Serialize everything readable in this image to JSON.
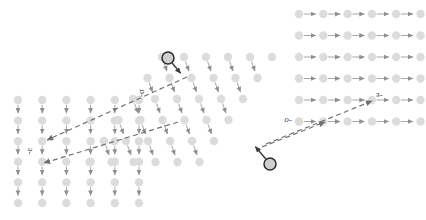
{
  "figure": {
    "type": "lattice-transition-diagram",
    "background": "#ffffff",
    "node_color": "#dcdcdc",
    "node_radius": 4.2,
    "arrow_color": "#8f8f8f",
    "dashed_color": "#6e6e6e",
    "highlight_stroke": "#2b2b2b",
    "highlight_fill": "#cfcfcf",
    "highlight_radius": 6.0,
    "label_color": "#4a4a4a"
  },
  "grids": [
    {
      "name": "left-grid",
      "arrow_direction": "down",
      "origin_x": 18,
      "origin_y": 100,
      "dx": 24.2,
      "dy": 20.6,
      "cols": 6,
      "rows": 6
    },
    {
      "name": "middle-grid",
      "arrow_direction": "down-right",
      "origin_x": 162,
      "origin_y": 57,
      "dx": 22.0,
      "dy": 21.0,
      "cols": 6,
      "rows": 6,
      "shear": -14.5
    },
    {
      "name": "right-grid",
      "arrow_direction": "right",
      "origin_x": 299,
      "origin_y": 14,
      "dx": 24.3,
      "dy": 21.5,
      "cols": 6,
      "rows": 6
    }
  ],
  "highlighted_nodes": [
    {
      "name": "highlight-node-top",
      "cx": 168,
      "cy": 58,
      "arrow_to_x": 182,
      "arrow_to_y": 75,
      "label": ""
    },
    {
      "name": "highlight-node-bottom",
      "cx": 270,
      "cy": 164,
      "arrow_to_x": 254,
      "arrow_to_y": 145,
      "label": ""
    }
  ],
  "transitions": [
    {
      "name": "sigma-left",
      "label": "-σ",
      "label_x": 144,
      "label_y": 93,
      "label_rotation": -90,
      "x1": 187,
      "y1": 77,
      "x2": 47,
      "y2": 140,
      "style": "dashed",
      "arrowhead": "end"
    },
    {
      "name": "epsilon-left",
      "label": "-ε",
      "label_x": 32,
      "label_y": 151,
      "label_rotation": -90,
      "x1": 178,
      "y1": 122,
      "x2": 44,
      "y2": 163,
      "style": "dashed",
      "arrowhead": "end"
    },
    {
      "name": "sigma-right",
      "label": "-σ",
      "label_x": 288,
      "label_y": 118,
      "label_rotation": 180,
      "x1": 266,
      "y1": 144,
      "x2": 372,
      "y2": 101,
      "style": "dashed",
      "arrowhead": "end"
    },
    {
      "name": "epsilon-right",
      "label": "-ε",
      "label_x": 379,
      "label_y": 93,
      "label_rotation": 180,
      "x1": 262,
      "y1": 147,
      "x2": 325,
      "y2": 122,
      "style": "dashed",
      "arrowhead": "end"
    }
  ],
  "labels": [
    {
      "name": "sigma-label-left",
      "text": "-σ"
    },
    {
      "name": "epsilon-label-left",
      "text": "-ε"
    },
    {
      "name": "sigma-label-right",
      "text": "-σ"
    },
    {
      "name": "epsilon-label-right",
      "text": "-ε"
    }
  ]
}
